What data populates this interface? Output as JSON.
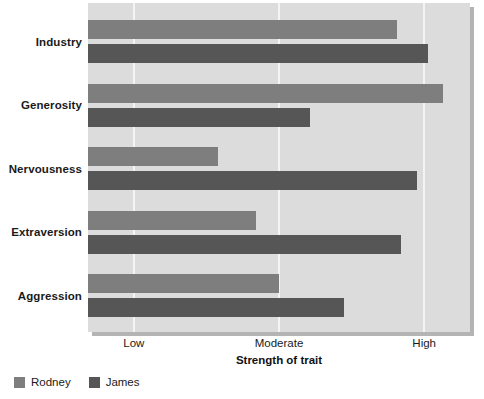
{
  "chart_data": {
    "type": "bar",
    "orientation": "horizontal",
    "title": "",
    "xlabel": "Strength of trait",
    "ylabel": "",
    "grid": true,
    "legend_position": "bottom-left",
    "xlim": [
      0,
      100
    ],
    "xtick_labels": [
      "Low",
      "Moderate",
      "High"
    ],
    "xtick_values": [
      12,
      50,
      88
    ],
    "categories": [
      "Industry",
      "Generosity",
      "Nervousness",
      "Extraversion",
      "Aggression"
    ],
    "series": [
      {
        "name": "Rodney",
        "color": "#7e7e7e",
        "values": [
          81,
          93,
          34,
          44,
          50
        ]
      },
      {
        "name": "James",
        "color": "#565656",
        "values": [
          89,
          58,
          86,
          82,
          67
        ]
      }
    ]
  },
  "legend": {
    "items": [
      {
        "label": "Rodney",
        "swatch": "rodney"
      },
      {
        "label": "James",
        "swatch": "james"
      }
    ]
  },
  "axis": {
    "x_title": "Strength of trait"
  },
  "colors": {
    "plot_background": "#dcdcdc",
    "gridline": "#f4f4f4",
    "rodney": "#7e7e7e",
    "james": "#565656"
  }
}
